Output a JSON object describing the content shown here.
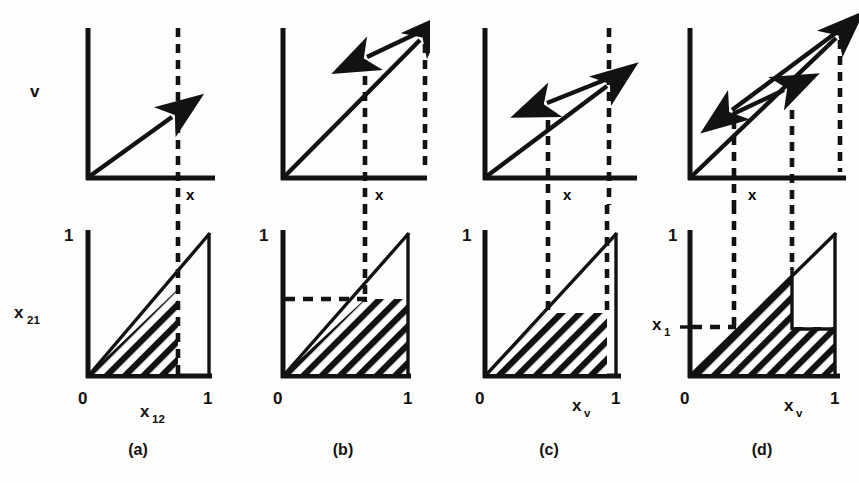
{
  "figure": {
    "type": "scientific-diagram",
    "background_color": "#fdfdfb",
    "ink_color": "#141210"
  },
  "panels": [
    {
      "id": "a",
      "caption": "(a)",
      "top": {
        "y_axis_label": "v",
        "x_axis_label": "x",
        "dashed_verticals": [
          0.6,
          1.0
        ],
        "arrows": [
          {
            "from": [
              0.0,
              0.0
            ],
            "to": [
              0.6,
              0.62
            ],
            "head": "end"
          }
        ]
      },
      "bottom": {
        "y_axis_label": "x21",
        "y_axis_label_base": "x",
        "y_axis_label_sub": "21",
        "y_top_tick": "1",
        "x_axis_label_base": "x",
        "x_axis_label_sub": "12",
        "x_ticks": [
          "0",
          "1"
        ],
        "point_labels": [
          "B",
          "A"
        ],
        "corner_label_right": "1",
        "dashed_verticals": [
          0.6
        ],
        "dashed_horizontals": [],
        "region": "triangle under diagonal truncated at x = 0.6"
      }
    },
    {
      "id": "b",
      "caption": "(b)",
      "top": {
        "y_axis_label": "",
        "x_axis_label": "x",
        "dashed_verticals": [
          0.6,
          1.0
        ],
        "arrows": [
          {
            "from": [
              0.0,
              0.0
            ],
            "to": [
              1.0,
              1.0
            ],
            "head": "end"
          },
          {
            "from": [
              1.0,
              1.0
            ],
            "to": [
              0.6,
              0.78
            ],
            "head": "end"
          }
        ]
      },
      "bottom": {
        "y_axis_label": "",
        "y_top_tick": "1",
        "x_axis_label_base": "",
        "x_axis_label_sub": "",
        "x_ticks": [
          "0",
          "1"
        ],
        "dashed_verticals": [
          0.6
        ],
        "dashed_horizontals": [
          0.57
        ],
        "region": "triangle under diagonal up to x = 0.6 plus rectangle to x = 1 capped at y = 0.57"
      }
    },
    {
      "id": "c",
      "caption": "(c)",
      "top": {
        "y_axis_label": "",
        "x_axis_label": "x",
        "dashed_verticals": [
          0.43,
          0.85
        ],
        "arrows": [
          {
            "from": [
              0.2,
              0.2
            ],
            "to": [
              0.85,
              0.88
            ],
            "head": "end"
          },
          {
            "from": [
              0.85,
              0.82
            ],
            "to": [
              0.33,
              0.56
            ],
            "head": "end"
          }
        ]
      },
      "bottom": {
        "y_axis_label": "",
        "y_top_tick": "1",
        "x_axis_label_base": "x",
        "x_axis_label_sub": "v",
        "x_ticks": [
          "0",
          "1"
        ],
        "dashed_verticals": [
          0.43,
          0.85
        ],
        "dashed_horizontals": [],
        "region": "triangle under diagonal up to x = 0.43 plus rectangle to x = 0.85 capped at y = 0.43"
      }
    },
    {
      "id": "d",
      "caption": "(d)",
      "top": {
        "y_axis_label": "",
        "x_axis_label": "x",
        "dashed_verticals": [
          0.37,
          0.72
        ],
        "arrows": [
          {
            "from": [
              0.05,
              0.05
            ],
            "to": [
              0.95,
              0.98
            ],
            "head": "end"
          },
          {
            "from": [
              0.95,
              0.95
            ],
            "to": [
              0.2,
              0.52
            ],
            "head": "end"
          },
          {
            "from": [
              0.2,
              0.45
            ],
            "to": [
              0.62,
              0.68
            ],
            "head": "end"
          }
        ]
      },
      "bottom": {
        "y_axis_label_base": "x",
        "y_axis_label_sub": "1",
        "y_top_tick": "1",
        "x_axis_label_base": "x",
        "x_axis_label_sub": "v",
        "x_ticks": [
          "0",
          "1"
        ],
        "dashed_verticals": [
          0.37,
          0.72
        ],
        "dashed_horizontals": [
          0.37
        ],
        "region": "full-width band below y = 0.37 plus triangle above between x = 0.37 and x = 0.72"
      }
    }
  ]
}
